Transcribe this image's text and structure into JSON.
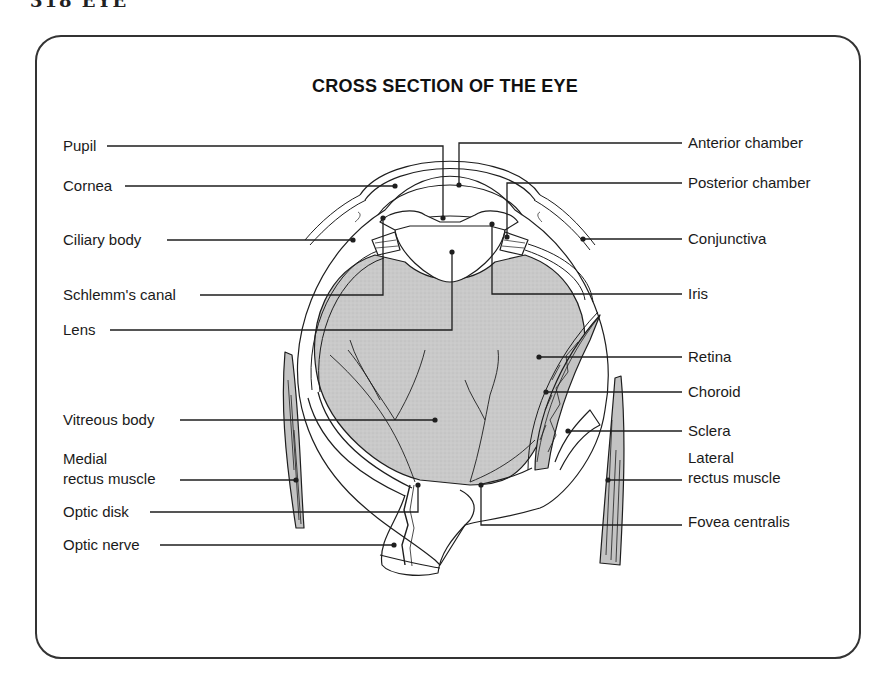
{
  "page": {
    "header": "318   EYE",
    "title": "CROSS SECTION OF THE EYE"
  },
  "colors": {
    "fill_gray": "#c8c8c8",
    "line": "#1e1e1e",
    "frame": "#333333"
  },
  "labels_left": [
    {
      "id": "pupil",
      "text": "Pupil",
      "x": 63,
      "y": 137
    },
    {
      "id": "cornea",
      "text": "Cornea",
      "x": 63,
      "y": 177
    },
    {
      "id": "ciliary-body",
      "text": "Ciliary body",
      "x": 63,
      "y": 231
    },
    {
      "id": "schlemms-canal",
      "text": "Schlemm's canal",
      "x": 63,
      "y": 286
    },
    {
      "id": "lens",
      "text": "Lens",
      "x": 63,
      "y": 321
    },
    {
      "id": "vitreous-body",
      "text": "Vitreous body",
      "x": 63,
      "y": 411
    },
    {
      "id": "medial-rectus-muscle",
      "text": "Medial\nrectus muscle",
      "line1": "Medial",
      "line2": "rectus muscle",
      "x": 63,
      "y": 449
    },
    {
      "id": "optic-disk",
      "text": "Optic disk",
      "x": 63,
      "y": 503
    },
    {
      "id": "optic-nerve",
      "text": "Optic nerve",
      "x": 63,
      "y": 536
    }
  ],
  "labels_right": [
    {
      "id": "anterior-chamber",
      "text": "Anterior chamber",
      "x": 688,
      "y": 134
    },
    {
      "id": "posterior-chamber",
      "text": "Posterior chamber",
      "x": 688,
      "y": 174
    },
    {
      "id": "conjunctiva",
      "text": "Conjunctiva",
      "x": 688,
      "y": 230
    },
    {
      "id": "iris",
      "text": "Iris",
      "x": 688,
      "y": 285
    },
    {
      "id": "retina",
      "text": "Retina",
      "x": 688,
      "y": 348
    },
    {
      "id": "choroid",
      "text": "Choroid",
      "x": 688,
      "y": 383
    },
    {
      "id": "sclera",
      "text": "Sclera",
      "x": 688,
      "y": 422
    },
    {
      "id": "lateral-rectus-muscle",
      "text": "Lateral\nrectus muscle",
      "line1": "Lateral",
      "line2": "rectus muscle",
      "x": 688,
      "y": 448
    },
    {
      "id": "fovea-centralis",
      "text": "Fovea centralis",
      "x": 688,
      "y": 513
    }
  ],
  "leaders": [
    {
      "id": "pupil",
      "points": "107,146 443,146 443,218",
      "dot": [
        443,
        218
      ]
    },
    {
      "id": "cornea",
      "points": "125,186 395,186",
      "dot": [
        395,
        186
      ]
    },
    {
      "id": "ciliary-body",
      "points": "167,240 353,240",
      "dot": [
        353,
        240
      ]
    },
    {
      "id": "schlemms-canal",
      "points": "200,295 383,295 383,218",
      "dot": [
        383,
        218
      ]
    },
    {
      "id": "lens",
      "points": "110,330 452,330 452,252",
      "dot": [
        452,
        252
      ]
    },
    {
      "id": "vitreous-body",
      "points": "180,420 435,420",
      "dot": [
        435,
        420
      ]
    },
    {
      "id": "medial-rectus-muscle",
      "points": "180,480 296,480",
      "dot": [
        296,
        480
      ]
    },
    {
      "id": "optic-disk",
      "points": "150,512 418,512 418,485",
      "dot": [
        418,
        485
      ]
    },
    {
      "id": "optic-nerve",
      "points": "160,545 394,545",
      "dot": [
        394,
        545
      ]
    },
    {
      "id": "anterior-chamber",
      "points": "682,143 459,143 459,185",
      "dot": [
        459,
        185
      ]
    },
    {
      "id": "posterior-chamber",
      "points": "682,183 507,183 507,237",
      "dot": [
        507,
        237
      ]
    },
    {
      "id": "conjunctiva",
      "points": "682,239 583,239",
      "dot": [
        583,
        239
      ]
    },
    {
      "id": "iris",
      "points": "682,294 492,294 492,224",
      "dot": [
        492,
        224
      ]
    },
    {
      "id": "retina",
      "points": "682,357 539,357",
      "dot": [
        539,
        357
      ]
    },
    {
      "id": "choroid",
      "points": "682,392 546,392",
      "dot": [
        546,
        392
      ]
    },
    {
      "id": "sclera",
      "points": "682,431 568,431",
      "dot": [
        568,
        431
      ]
    },
    {
      "id": "lateral-rectus-muscle",
      "points": "682,480 608,480",
      "dot": [
        608,
        480
      ]
    },
    {
      "id": "fovea-centralis",
      "points": "682,525 481,525 481,485",
      "dot": [
        481,
        485
      ]
    }
  ]
}
